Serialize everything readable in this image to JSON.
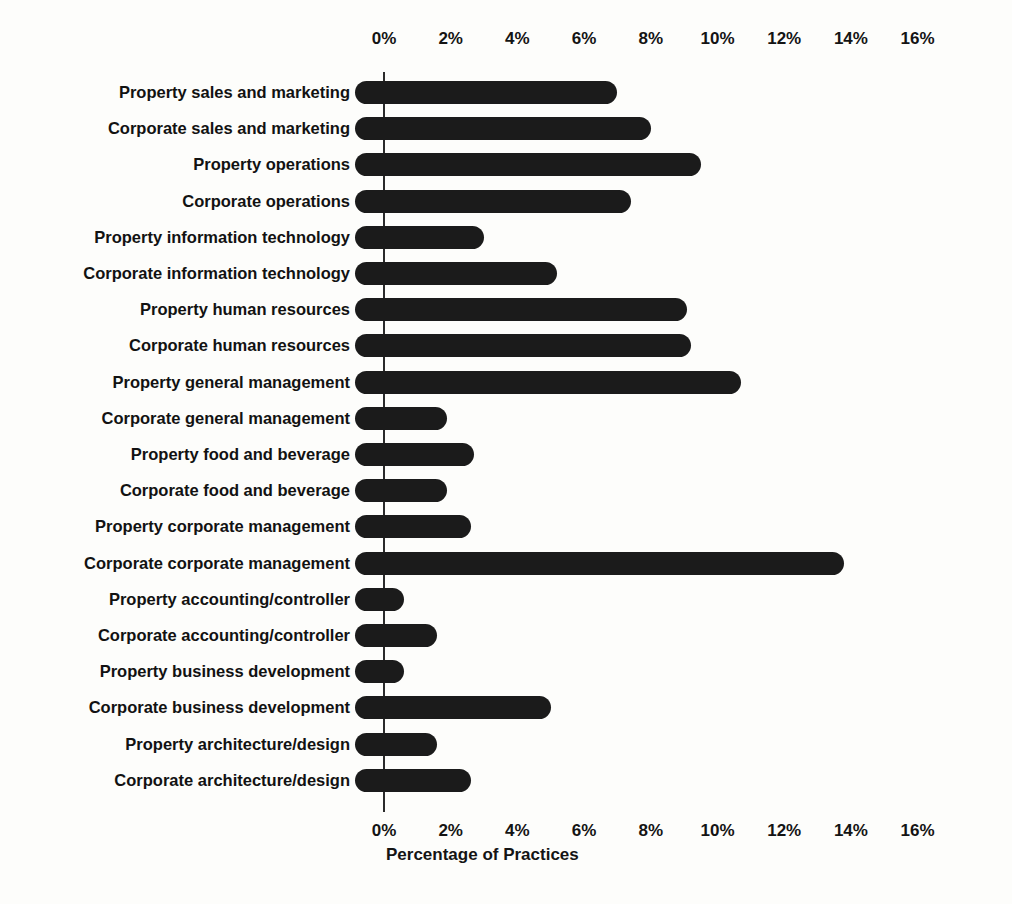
{
  "chart_data": {
    "type": "bar",
    "orientation": "horizontal",
    "title": "",
    "xlabel": "Percentage of Practices",
    "ylabel": "",
    "xlim": [
      0,
      16
    ],
    "grid": false,
    "legend": false,
    "xtick_labels": [
      "0%",
      "2%",
      "4%",
      "6%",
      "8%",
      "10%",
      "12%",
      "14%",
      "16%"
    ],
    "xtick_values": [
      0,
      2,
      4,
      6,
      8,
      10,
      12,
      14,
      16
    ],
    "axis_positions": "top-and-bottom",
    "bar_color": "#1b1b1b",
    "categories": [
      "Property sales and marketing",
      "Corporate sales and marketing",
      "Property operations",
      "Corporate operations",
      "Property information technology",
      "Corporate information technology",
      "Property human resources",
      "Corporate human resources",
      "Property general management",
      "Corporate general management",
      "Property food and beverage",
      "Corporate food and beverage",
      "Property corporate management",
      "Corporate corporate management",
      "Property accounting/controller",
      "Corporate accounting/controller",
      "Property business development",
      "Corporate business development",
      "Property architecture/design",
      "Corporate architecture/design"
    ],
    "values": [
      7.0,
      8.0,
      9.5,
      7.4,
      3.0,
      5.2,
      9.1,
      9.2,
      10.7,
      1.9,
      2.7,
      1.9,
      2.6,
      13.8,
      0.6,
      1.6,
      0.6,
      5.0,
      1.6,
      2.6
    ]
  }
}
